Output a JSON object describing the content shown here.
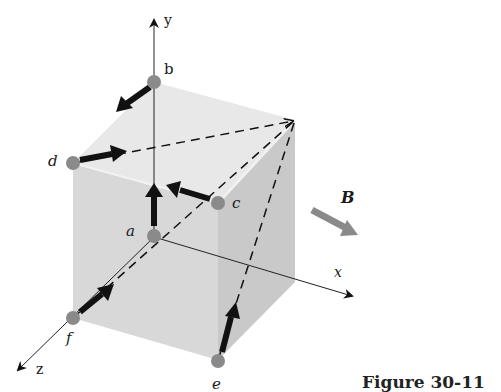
{
  "figure": {
    "caption": "Figure 30-11",
    "axes": {
      "x_label": "x",
      "y_label": "y",
      "z_label": "z"
    },
    "field": {
      "label": "B",
      "description": "uniform magnetic field directed along +x"
    },
    "points": [
      {
        "id": "a",
        "label": "a",
        "location": "origin, on front face",
        "arrow": "up (+y)"
      },
      {
        "id": "b",
        "label": "b",
        "location": "top of y-axis, back-left top corner",
        "arrow": "toward front-left (+z)"
      },
      {
        "id": "c",
        "label": "c",
        "location": "front-right top corner",
        "arrow": "toward a (-x)"
      },
      {
        "id": "d",
        "label": "d",
        "location": "front-left top corner",
        "arrow": "toward back-right top vertex (dashed)"
      },
      {
        "id": "e",
        "label": "e",
        "location": "front-right bottom corner",
        "arrow": "toward back-right top vertex (dashed)"
      },
      {
        "id": "f",
        "label": "f",
        "location": "front-left bottom corner on z-axis",
        "arrow": "toward a / back-right top vertex (dashed)"
      }
    ],
    "colors": {
      "top_face": "#e6e6e6",
      "front_face": "#d9d9d9",
      "right_face": "#c8c8c8",
      "point": "#888888",
      "arrow": "#111111",
      "field_arrow": "#8a8a8a"
    }
  }
}
